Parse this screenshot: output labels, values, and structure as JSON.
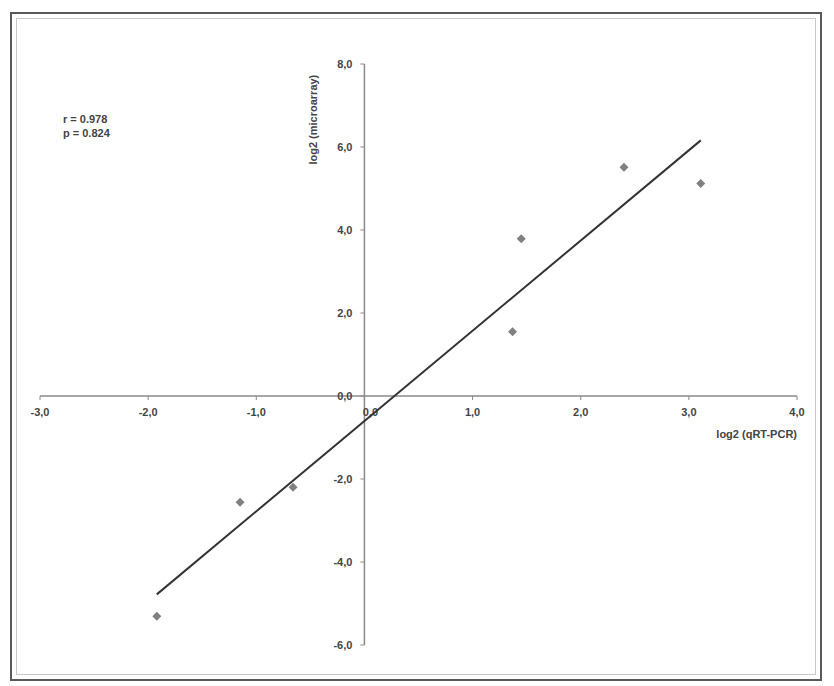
{
  "chart_data": {
    "type": "scatter",
    "title": "",
    "xlabel": "log2 (qRT-PCR)",
    "ylabel": "log2 (microarray)",
    "xlim": [
      -3.0,
      4.0
    ],
    "ylim": [
      -6.0,
      8.0
    ],
    "x_ticks": [
      "-3,0",
      "-2,0",
      "-1,0",
      "0,0",
      "1,0",
      "2,0",
      "3,0",
      "4,0"
    ],
    "y_ticks": [
      "8,0",
      "6,0",
      "4,0",
      "2,0",
      "0,0",
      "-2,0",
      "-4,0",
      "-6,0"
    ],
    "grid": false,
    "legend": null,
    "series": [
      {
        "name": "genes",
        "marker": "diamond",
        "color": "#808080",
        "points": [
          {
            "x": -1.92,
            "y": -5.31
          },
          {
            "x": -1.15,
            "y": -2.56
          },
          {
            "x": -0.66,
            "y": -2.2
          },
          {
            "x": 1.37,
            "y": 1.55
          },
          {
            "x": 1.45,
            "y": 3.79
          },
          {
            "x": 2.4,
            "y": 5.51
          },
          {
            "x": 3.11,
            "y": 5.12
          }
        ]
      }
    ],
    "trendline": {
      "type": "linear",
      "x0": -1.92,
      "y0": -4.78,
      "x1": 3.11,
      "y1": 6.16,
      "color": "#333333"
    },
    "annotations": [
      "r = 0.978",
      "p = 0.824"
    ]
  },
  "stats": {
    "r_label": "r = 0.978",
    "p_label": "p = 0.824"
  }
}
